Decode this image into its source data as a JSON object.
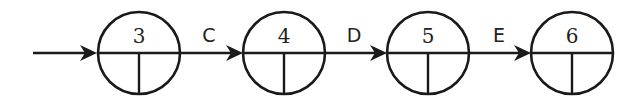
{
  "diagram": {
    "type": "activity-on-arrow network",
    "nodes": [
      {
        "id": "3",
        "label": "3"
      },
      {
        "id": "4",
        "label": "4"
      },
      {
        "id": "5",
        "label": "5"
      },
      {
        "id": "6",
        "label": "6"
      }
    ],
    "edges": [
      {
        "from": "",
        "to": "3",
        "label": ""
      },
      {
        "from": "3",
        "to": "4",
        "label": "C"
      },
      {
        "from": "4",
        "to": "5",
        "label": "D"
      },
      {
        "from": "5",
        "to": "6",
        "label": "E"
      }
    ]
  }
}
